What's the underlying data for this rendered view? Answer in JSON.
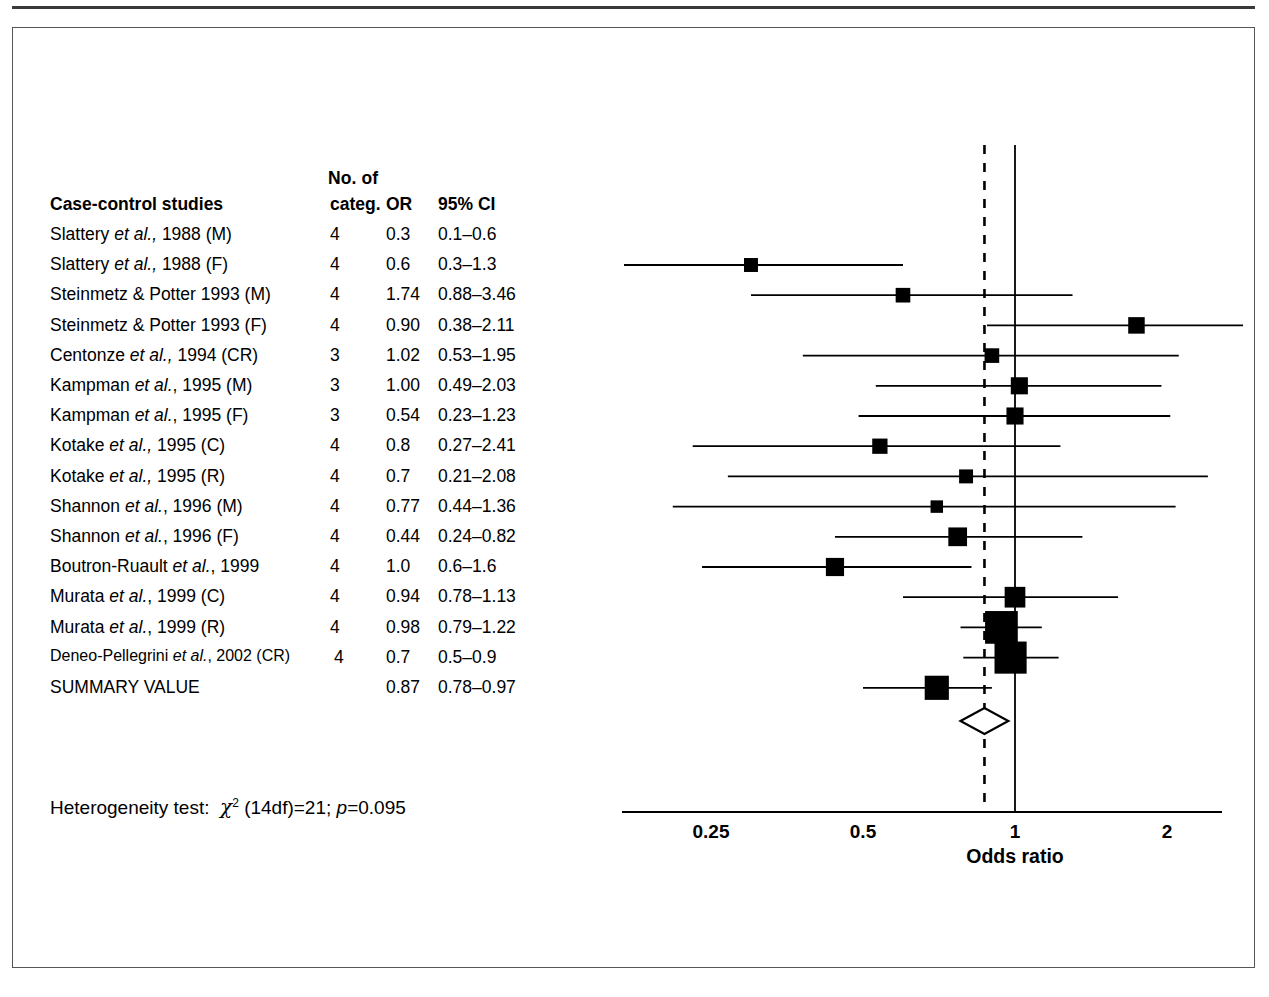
{
  "figure": {
    "kind": "forest-plot",
    "table": {
      "header_top": "No. of",
      "headers": {
        "study": "Case-control studies",
        "categ": "categ.",
        "or": "OR",
        "ci": "95% CI"
      },
      "rows": [
        {
          "study_pre": "Slattery ",
          "study_ital": "et al.,",
          "study_post": " 1988 (M)",
          "categ": "4",
          "or": "0.3",
          "ci": "0.1–0.6"
        },
        {
          "study_pre": "Slattery ",
          "study_ital": "et al.,",
          "study_post": " 1988 (F)",
          "categ": "4",
          "or": "0.6",
          "ci": "0.3–1.3"
        },
        {
          "study_pre": "Steinmetz & Potter 1993 (M)",
          "study_ital": "",
          "study_post": "",
          "categ": "4",
          "or": "1.74",
          "ci": "0.88–3.46"
        },
        {
          "study_pre": "Steinmetz & Potter 1993 (F)",
          "study_ital": "",
          "study_post": "",
          "categ": "4",
          "or": "0.90",
          "ci": "0.38–2.11"
        },
        {
          "study_pre": "Centonze ",
          "study_ital": "et al.,",
          "study_post": " 1994 (CR)",
          "categ": "3",
          "or": "1.02",
          "ci": "0.53–1.95"
        },
        {
          "study_pre": "Kampman ",
          "study_ital": "et al.",
          "study_post": ", 1995 (M)",
          "categ": "3",
          "or": "1.00",
          "ci": "0.49–2.03"
        },
        {
          "study_pre": "Kampman ",
          "study_ital": "et al.",
          "study_post": ", 1995 (F)",
          "categ": "3",
          "or": "0.54",
          "ci": "0.23–1.23"
        },
        {
          "study_pre": "Kotake ",
          "study_ital": "et al.,",
          "study_post": " 1995 (C)",
          "categ": "4",
          "or": "0.8",
          "ci": "0.27–2.41"
        },
        {
          "study_pre": "Kotake ",
          "study_ital": "et al.,",
          "study_post": " 1995 (R)",
          "categ": "4",
          "or": "0.7",
          "ci": "0.21–2.08"
        },
        {
          "study_pre": "Shannon ",
          "study_ital": "et al.",
          "study_post": ", 1996 (M)",
          "categ": "4",
          "or": "0.77",
          "ci": "0.44–1.36"
        },
        {
          "study_pre": "Shannon ",
          "study_ital": "et al.",
          "study_post": ", 1996 (F)",
          "categ": "4",
          "or": "0.44",
          "ci": "0.24–0.82"
        },
        {
          "study_pre": "Boutron-Ruault ",
          "study_ital": "et al.",
          "study_post": ", 1999",
          "categ": "4",
          "or": "1.0",
          "ci": "0.6–1.6"
        },
        {
          "study_pre": "Murata ",
          "study_ital": "et al.",
          "study_post": ", 1999 (C)",
          "categ": "4",
          "or": "0.94",
          "ci": "0.78–1.13"
        },
        {
          "study_pre": "Murata ",
          "study_ital": "et al.",
          "study_post": ", 1999 (R)",
          "categ": "4",
          "or": "0.98",
          "ci": "0.79–1.22"
        },
        {
          "study_pre": "Deneo-Pellegrini ",
          "study_ital": "et al.",
          "study_post": ", 2002 (CR)",
          "categ": "4",
          "or": "0.7",
          "ci": "0.5–0.9"
        },
        {
          "study_pre": "SUMMARY VALUE",
          "study_ital": "",
          "study_post": "",
          "categ": "",
          "or": "0.87",
          "ci": "0.78–0.97"
        }
      ]
    },
    "heterogeneity": {
      "prefix": "Heterogeneity test:",
      "chi_symbol": "χ",
      "chi_exponent": "2",
      "df_term": "(14df)=21;",
      "p_symbol": "p",
      "p_value": "=0.095"
    },
    "axis": {
      "title": "Odds ratio",
      "ticks": [
        "0.25",
        "0.5",
        "1",
        "2"
      ],
      "tick_values": [
        0.25,
        0.5,
        1,
        2
      ],
      "scale": "log",
      "null_line": 1,
      "summary_line": 0.87
    }
  },
  "chart_data": {
    "type": "forest",
    "title": "",
    "xlabel": "Odds ratio",
    "ylabel": "",
    "scale": "log",
    "xlim": [
      0.2,
      2.3
    ],
    "xticks": [
      0.25,
      0.5,
      1,
      2
    ],
    "xticklabels": [
      "0.25",
      "0.5",
      "1",
      "2"
    ],
    "reference_line": 1,
    "summary_line": 0.87,
    "grid": false,
    "legend": "none",
    "studies": [
      {
        "label": "Slattery et al., 1988 (M)",
        "categ": 4,
        "or": 0.3,
        "lo": 0.1,
        "hi": 0.6,
        "weight": 1.0
      },
      {
        "label": "Slattery et al., 1988 (F)",
        "categ": 4,
        "or": 0.6,
        "lo": 0.3,
        "hi": 1.3,
        "weight": 1.1
      },
      {
        "label": "Steinmetz & Potter 1993 (M)",
        "categ": 4,
        "or": 1.74,
        "lo": 0.88,
        "hi": 3.46,
        "weight": 1.4
      },
      {
        "label": "Steinmetz & Potter 1993 (F)",
        "categ": 4,
        "or": 0.9,
        "lo": 0.38,
        "hi": 2.11,
        "weight": 1.1
      },
      {
        "label": "Centonze et al., 1994 (CR)",
        "categ": 3,
        "or": 1.02,
        "lo": 0.53,
        "hi": 1.95,
        "weight": 1.5
      },
      {
        "label": "Kampman et al., 1995 (M)",
        "categ": 3,
        "or": 1.0,
        "lo": 0.49,
        "hi": 2.03,
        "weight": 1.5
      },
      {
        "label": "Kampman et al., 1995 (F)",
        "categ": 3,
        "or": 0.54,
        "lo": 0.23,
        "hi": 1.23,
        "weight": 1.2
      },
      {
        "label": "Kotake et al., 1995 (C)",
        "categ": 4,
        "or": 0.8,
        "lo": 0.27,
        "hi": 2.41,
        "weight": 1.0
      },
      {
        "label": "Kotake et al., 1995 (R)",
        "categ": 4,
        "or": 0.7,
        "lo": 0.21,
        "hi": 2.08,
        "weight": 0.8
      },
      {
        "label": "Shannon et al., 1996 (M)",
        "categ": 4,
        "or": 0.77,
        "lo": 0.44,
        "hi": 1.36,
        "weight": 1.8
      },
      {
        "label": "Shannon et al., 1996 (F)",
        "categ": 4,
        "or": 0.44,
        "lo": 0.24,
        "hi": 0.82,
        "weight": 1.7
      },
      {
        "label": "Boutron-Ruault et al., 1999",
        "categ": 4,
        "or": 1.0,
        "lo": 0.6,
        "hi": 1.6,
        "weight": 2.2
      },
      {
        "label": "Murata et al., 1999 (C)",
        "categ": 4,
        "or": 0.94,
        "lo": 0.78,
        "hi": 1.13,
        "weight": 5.5
      },
      {
        "label": "Murata et al., 1999 (R)",
        "categ": 4,
        "or": 0.98,
        "lo": 0.79,
        "hi": 1.22,
        "weight": 5.3
      },
      {
        "label": "Deneo-Pellegrini et al., 2002 (CR)",
        "categ": 4,
        "or": 0.7,
        "lo": 0.5,
        "hi": 0.9,
        "weight": 3.0
      }
    ],
    "summary": {
      "label": "SUMMARY VALUE",
      "or": 0.87,
      "lo": 0.78,
      "hi": 0.97
    }
  }
}
